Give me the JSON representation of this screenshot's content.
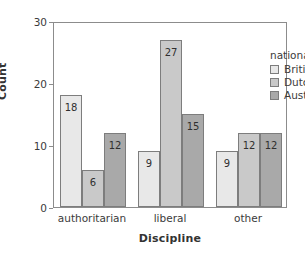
{
  "chart_data": {
    "type": "bar",
    "title": "",
    "xlabel": "Discipline",
    "ylabel": "Count",
    "categories": [
      "authoritarian",
      "liberal",
      "other"
    ],
    "series": [
      {
        "name": "British",
        "values": [
          18,
          9,
          9
        ],
        "color": "#e8e8e8"
      },
      {
        "name": "Dutch",
        "values": [
          6,
          27,
          12
        ],
        "color": "#c9c9c9"
      },
      {
        "name": "Australian",
        "values": [
          12,
          15,
          12
        ],
        "color": "#a9a9a9"
      }
    ],
    "ylim": [
      0,
      30
    ],
    "yticks": [
      0,
      10,
      20,
      30
    ],
    "ytick_labels": [
      "0",
      "10",
      "20",
      "30"
    ],
    "grid": false,
    "legend_position": "top-right",
    "legend_title": "nationality",
    "show_value_labels": true
  },
  "axis": {
    "y_title": "Count",
    "x_title": "Discipline"
  },
  "legend": {
    "title": "nationality"
  }
}
